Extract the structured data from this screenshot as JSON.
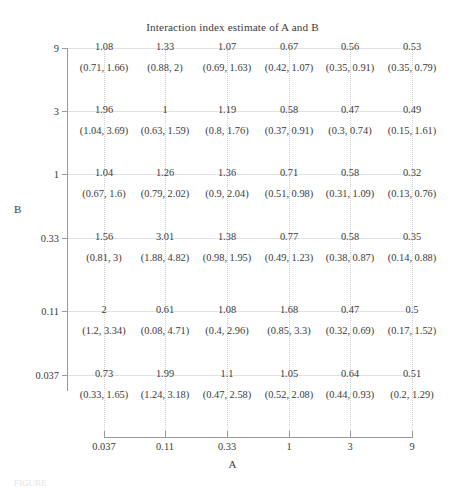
{
  "chart_data": {
    "type": "table",
    "title": "Interaction index estimate of A and B",
    "xlabel": "A",
    "ylabel": "B",
    "grid": true,
    "legend": "none",
    "x_tick_labels": [
      "0.037",
      "0.11",
      "0.33",
      "1",
      "3",
      "9"
    ],
    "y_tick_labels": [
      "9",
      "3",
      "1",
      "0.33",
      "0.11",
      "0.037"
    ],
    "x_categories": [
      "0.037",
      "0.11",
      "0.33",
      "1",
      "3",
      "9"
    ],
    "y_categories": [
      "9",
      "3",
      "1",
      "0.33",
      "0.11",
      "0.037"
    ],
    "cell_format": "estimate with 95% confidence interval (lower, upper)",
    "rows": [
      {
        "b": "9",
        "cells": [
          {
            "a": "0.037",
            "estimate": "1.08",
            "ci": "(0.71, 1.66)",
            "value": 1.08,
            "lower": 0.71,
            "upper": 1.66
          },
          {
            "a": "0.11",
            "estimate": "1.33",
            "ci": "(0.88, 2)",
            "value": 1.33,
            "lower": 0.88,
            "upper": 2.0
          },
          {
            "a": "0.33",
            "estimate": "1.07",
            "ci": "(0.69, 1.63)",
            "value": 1.07,
            "lower": 0.69,
            "upper": 1.63
          },
          {
            "a": "1",
            "estimate": "0.67",
            "ci": "(0.42, 1.07)",
            "value": 0.67,
            "lower": 0.42,
            "upper": 1.07
          },
          {
            "a": "3",
            "estimate": "0.56",
            "ci": "(0.35, 0.91)",
            "value": 0.56,
            "lower": 0.35,
            "upper": 0.91
          },
          {
            "a": "9",
            "estimate": "0.53",
            "ci": "(0.35, 0.79)",
            "value": 0.53,
            "lower": 0.35,
            "upper": 0.79
          }
        ]
      },
      {
        "b": "3",
        "cells": [
          {
            "a": "0.037",
            "estimate": "1.96",
            "ci": "(1.04, 3.69)",
            "value": 1.96,
            "lower": 1.04,
            "upper": 3.69
          },
          {
            "a": "0.11",
            "estimate": "1",
            "ci": "(0.63, 1.59)",
            "value": 1.0,
            "lower": 0.63,
            "upper": 1.59
          },
          {
            "a": "0.33",
            "estimate": "1.19",
            "ci": "(0.8, 1.76)",
            "value": 1.19,
            "lower": 0.8,
            "upper": 1.76
          },
          {
            "a": "1",
            "estimate": "0.58",
            "ci": "(0.37, 0.91)",
            "value": 0.58,
            "lower": 0.37,
            "upper": 0.91
          },
          {
            "a": "3",
            "estimate": "0.47",
            "ci": "(0.3, 0.74)",
            "value": 0.47,
            "lower": 0.3,
            "upper": 0.74
          },
          {
            "a": "9",
            "estimate": "0.49",
            "ci": "(0.15, 1.61)",
            "value": 0.49,
            "lower": 0.15,
            "upper": 1.61
          }
        ]
      },
      {
        "b": "1",
        "cells": [
          {
            "a": "0.037",
            "estimate": "1.04",
            "ci": "(0.67, 1.6)",
            "value": 1.04,
            "lower": 0.67,
            "upper": 1.6
          },
          {
            "a": "0.11",
            "estimate": "1.26",
            "ci": "(0.79, 2.02)",
            "value": 1.26,
            "lower": 0.79,
            "upper": 2.02
          },
          {
            "a": "0.33",
            "estimate": "1.36",
            "ci": "(0.9, 2.04)",
            "value": 1.36,
            "lower": 0.9,
            "upper": 2.04
          },
          {
            "a": "1",
            "estimate": "0.71",
            "ci": "(0.51, 0.98)",
            "value": 0.71,
            "lower": 0.51,
            "upper": 0.98
          },
          {
            "a": "3",
            "estimate": "0.58",
            "ci": "(0.31, 1.09)",
            "value": 0.58,
            "lower": 0.31,
            "upper": 1.09
          },
          {
            "a": "9",
            "estimate": "0.32",
            "ci": "(0.13, 0.76)",
            "value": 0.32,
            "lower": 0.13,
            "upper": 0.76
          }
        ]
      },
      {
        "b": "0.33",
        "cells": [
          {
            "a": "0.037",
            "estimate": "1.56",
            "ci": "(0.81, 3)",
            "value": 1.56,
            "lower": 0.81,
            "upper": 3.0
          },
          {
            "a": "0.11",
            "estimate": "3.01",
            "ci": "(1.88, 4.82)",
            "value": 3.01,
            "lower": 1.88,
            "upper": 4.82
          },
          {
            "a": "0.33",
            "estimate": "1.38",
            "ci": "(0.98, 1.95)",
            "value": 1.38,
            "lower": 0.98,
            "upper": 1.95
          },
          {
            "a": "1",
            "estimate": "0.77",
            "ci": "(0.49, 1.23)",
            "value": 0.77,
            "lower": 0.49,
            "upper": 1.23
          },
          {
            "a": "3",
            "estimate": "0.58",
            "ci": "(0.38, 0.87)",
            "value": 0.58,
            "lower": 0.38,
            "upper": 0.87
          },
          {
            "a": "9",
            "estimate": "0.35",
            "ci": "(0.14, 0.88)",
            "value": 0.35,
            "lower": 0.14,
            "upper": 0.88
          }
        ]
      },
      {
        "b": "0.11",
        "cells": [
          {
            "a": "0.037",
            "estimate": "2",
            "ci": "(1.2, 3.34)",
            "value": 2.0,
            "lower": 1.2,
            "upper": 3.34
          },
          {
            "a": "0.11",
            "estimate": "0.61",
            "ci": "(0.08, 4.71)",
            "value": 0.61,
            "lower": 0.08,
            "upper": 4.71
          },
          {
            "a": "0.33",
            "estimate": "1.08",
            "ci": "(0.4, 2.96)",
            "value": 1.08,
            "lower": 0.4,
            "upper": 2.96
          },
          {
            "a": "1",
            "estimate": "1.68",
            "ci": "(0.85, 3.3)",
            "value": 1.68,
            "lower": 0.85,
            "upper": 3.3
          },
          {
            "a": "3",
            "estimate": "0.47",
            "ci": "(0.32, 0.69)",
            "value": 0.47,
            "lower": 0.32,
            "upper": 0.69
          },
          {
            "a": "9",
            "estimate": "0.5",
            "ci": "(0.17, 1.52)",
            "value": 0.5,
            "lower": 0.17,
            "upper": 1.52
          }
        ]
      },
      {
        "b": "0.037",
        "cells": [
          {
            "a": "0.037",
            "estimate": "0.73",
            "ci": "(0.33, 1.65)",
            "value": 0.73,
            "lower": 0.33,
            "upper": 1.65
          },
          {
            "a": "0.11",
            "estimate": "1.99",
            "ci": "(1.24, 3.18)",
            "value": 1.99,
            "lower": 1.24,
            "upper": 3.18
          },
          {
            "a": "0.33",
            "estimate": "1.1",
            "ci": "(0.47, 2.58)",
            "value": 1.1,
            "lower": 0.47,
            "upper": 2.58
          },
          {
            "a": "1",
            "estimate": "1.05",
            "ci": "(0.52, 2.08)",
            "value": 1.05,
            "lower": 0.52,
            "upper": 2.08
          },
          {
            "a": "3",
            "estimate": "0.64",
            "ci": "(0.44, 0.93)",
            "value": 0.64,
            "lower": 0.44,
            "upper": 0.93
          },
          {
            "a": "9",
            "estimate": "0.51",
            "ci": "(0.2, 1.29)",
            "value": 0.51,
            "lower": 0.2,
            "upper": 1.29
          }
        ]
      }
    ]
  },
  "colors": {
    "text": "#3a3a3a",
    "axis": "#9a9a9a",
    "vgrid": "#cfcfcf",
    "hgrid": "#e2e2e2",
    "background": "#ffffff"
  }
}
